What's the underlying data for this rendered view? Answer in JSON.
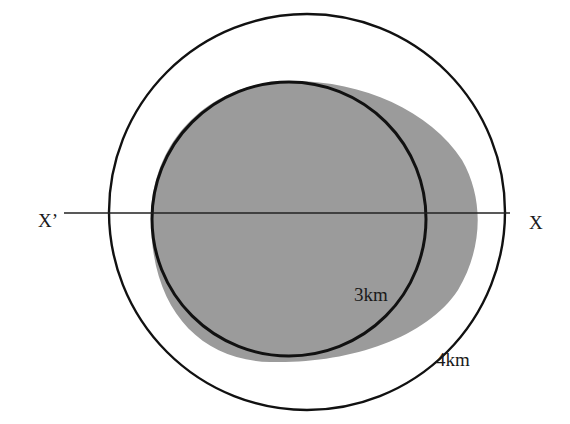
{
  "diagram": {
    "title": "",
    "axis_line": {
      "left_label": "X’",
      "right_label": "X"
    },
    "circles": [
      {
        "id": "outer",
        "label": "4km",
        "radius_km": 4
      },
      {
        "id": "inner",
        "label": "3km",
        "radius_km": 3
      }
    ],
    "shaded_region": {
      "fill": "#9a9a9a",
      "description": "shaded area offset toward X"
    },
    "colors": {
      "stroke": "#111111",
      "shade": "#9a9a9a",
      "background": "#ffffff"
    }
  }
}
